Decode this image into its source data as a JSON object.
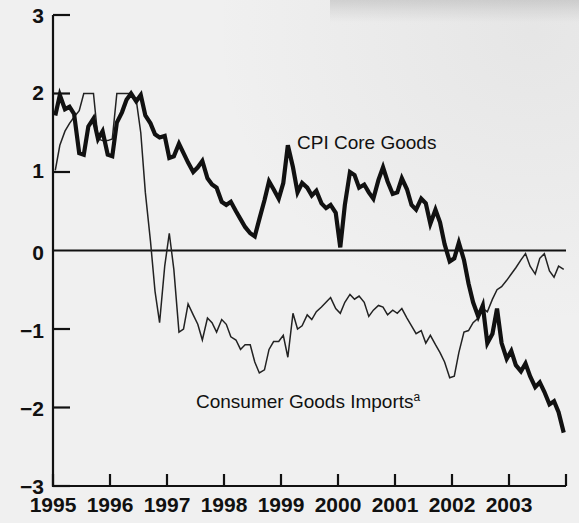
{
  "chart_data": {
    "type": "line",
    "title": "",
    "subtitle": "",
    "xlabel": "",
    "ylabel": "",
    "xlim": [
      1995.0,
      2004.0
    ],
    "ylim": [
      -3,
      3
    ],
    "grid": false,
    "legend_position": "inline-annotation",
    "y_ticks": [
      "3",
      "2",
      "1",
      "0",
      "−1",
      "−2",
      "−3"
    ],
    "y_tick_values": [
      3,
      2,
      1,
      0,
      -1,
      -2,
      -3
    ],
    "x_ticks": [
      "1995",
      "1996",
      "1997",
      "1998",
      "1999",
      "2000",
      "2001",
      "2002",
      "2003"
    ],
    "x_tick_values": [
      1995,
      1996,
      1997,
      1998,
      1999,
      2000,
      2001,
      2002,
      2003
    ],
    "zero_line": 0,
    "units": "percent change from year earlier",
    "series": [
      {
        "name": "CPI Core Goods",
        "label": "CPI Core Goods",
        "style": "thick",
        "color": "#111111",
        "line_width": 4.2,
        "label_x": 297,
        "label_y": 133,
        "x": [
          1995.04,
          1995.12,
          1995.21,
          1995.29,
          1995.37,
          1995.46,
          1995.54,
          1995.62,
          1995.71,
          1995.79,
          1995.87,
          1995.96,
          1996.04,
          1996.12,
          1996.21,
          1996.29,
          1996.37,
          1996.46,
          1996.54,
          1996.62,
          1996.71,
          1996.79,
          1996.87,
          1996.96,
          1997.04,
          1997.12,
          1997.21,
          1997.29,
          1997.37,
          1997.46,
          1997.54,
          1997.62,
          1997.71,
          1997.79,
          1997.87,
          1997.96,
          1998.04,
          1998.12,
          1998.21,
          1998.29,
          1998.37,
          1998.46,
          1998.54,
          1998.62,
          1998.71,
          1998.79,
          1998.87,
          1998.96,
          1999.04,
          1999.12,
          1999.21,
          1999.29,
          1999.37,
          1999.46,
          1999.54,
          1999.62,
          1999.71,
          1999.79,
          1999.87,
          1999.96,
          2000.04,
          2000.12,
          2000.21,
          2000.29,
          2000.37,
          2000.46,
          2000.54,
          2000.62,
          2000.71,
          2000.79,
          2000.87,
          2000.96,
          2001.04,
          2001.12,
          2001.21,
          2001.29,
          2001.37,
          2001.46,
          2001.54,
          2001.62,
          2001.71,
          2001.79,
          2001.87,
          2001.96,
          2002.04,
          2002.12,
          2002.21,
          2002.29,
          2002.37,
          2002.46,
          2002.54,
          2002.62,
          2002.71,
          2002.79,
          2002.87,
          2002.96,
          2003.04,
          2003.12,
          2003.21,
          2003.29,
          2003.37,
          2003.46,
          2003.54,
          2003.62,
          2003.71,
          2003.79,
          2003.87,
          2003.96
        ],
        "y": [
          1.72,
          1.98,
          1.8,
          1.83,
          1.74,
          1.24,
          1.22,
          1.58,
          1.68,
          1.42,
          1.52,
          1.22,
          1.2,
          1.63,
          1.76,
          1.92,
          2.0,
          1.9,
          1.98,
          1.72,
          1.62,
          1.48,
          1.44,
          1.46,
          1.18,
          1.2,
          1.36,
          1.24,
          1.12,
          1.0,
          1.06,
          1.14,
          0.92,
          0.84,
          0.8,
          0.62,
          0.58,
          0.62,
          0.5,
          0.4,
          0.3,
          0.22,
          0.18,
          0.4,
          0.64,
          0.88,
          0.78,
          0.66,
          0.86,
          1.34,
          1.06,
          0.74,
          0.86,
          0.8,
          0.7,
          0.76,
          0.6,
          0.54,
          0.58,
          0.48,
          0.04,
          0.58,
          1.0,
          0.96,
          0.8,
          0.84,
          0.74,
          0.66,
          0.9,
          1.06,
          0.88,
          0.72,
          0.74,
          0.92,
          0.78,
          0.58,
          0.52,
          0.66,
          0.6,
          0.34,
          0.52,
          0.36,
          0.08,
          -0.14,
          -0.1,
          0.1,
          -0.12,
          -0.42,
          -0.66,
          -0.84,
          -0.7,
          -1.18,
          -1.06,
          -0.74,
          -1.18,
          -1.38,
          -1.28,
          -1.46,
          -1.54,
          -1.44,
          -1.6,
          -1.74,
          -1.68,
          -1.8,
          -1.96,
          -1.92,
          -2.06,
          -2.32
        ]
      },
      {
        "name": "Consumer Goods Imports",
        "label": "Consumer Goods Imports",
        "label_superscript": "a",
        "style": "thin",
        "color": "#222222",
        "line_width": 1.5,
        "label_x": 196,
        "label_y": 392,
        "x": [
          1995.04,
          1995.12,
          1995.21,
          1995.29,
          1995.37,
          1995.46,
          1995.54,
          1995.62,
          1995.71,
          1995.79,
          1995.87,
          1995.96,
          1996.04,
          1996.12,
          1996.21,
          1996.29,
          1996.37,
          1996.46,
          1996.54,
          1996.62,
          1996.71,
          1996.79,
          1996.87,
          1996.96,
          1997.04,
          1997.12,
          1997.21,
          1997.29,
          1997.37,
          1997.46,
          1997.54,
          1997.62,
          1997.71,
          1997.79,
          1997.87,
          1997.96,
          1998.04,
          1998.12,
          1998.21,
          1998.29,
          1998.37,
          1998.46,
          1998.54,
          1998.62,
          1998.71,
          1998.79,
          1998.87,
          1998.96,
          1999.04,
          1999.12,
          1999.21,
          1999.29,
          1999.37,
          1999.46,
          1999.54,
          1999.62,
          1999.71,
          1999.79,
          1999.87,
          1999.96,
          2000.04,
          2000.12,
          2000.21,
          2000.29,
          2000.37,
          2000.46,
          2000.54,
          2000.62,
          2000.71,
          2000.79,
          2000.87,
          2000.96,
          2001.04,
          2001.12,
          2001.21,
          2001.29,
          2001.37,
          2001.46,
          2001.54,
          2001.62,
          2001.71,
          2001.79,
          2001.87,
          2001.96,
          2002.04,
          2002.12,
          2002.21,
          2002.29,
          2002.37,
          2002.46,
          2002.54,
          2002.62,
          2002.71,
          2002.79,
          2002.87,
          2002.96,
          2003.04,
          2003.12,
          2003.21,
          2003.29,
          2003.37,
          2003.46,
          2003.54,
          2003.62,
          2003.71,
          2003.79,
          2003.87,
          2003.96
        ],
        "y": [
          1.02,
          1.34,
          1.52,
          1.62,
          1.7,
          1.78,
          2.0,
          2.0,
          2.0,
          1.42,
          1.4,
          1.4,
          1.42,
          2.0,
          2.0,
          2.0,
          2.0,
          1.92,
          1.5,
          0.74,
          0.12,
          -0.52,
          -0.92,
          -0.2,
          0.22,
          -0.24,
          -1.04,
          -1.0,
          -0.68,
          -0.82,
          -0.94,
          -1.14,
          -0.86,
          -0.92,
          -1.04,
          -0.88,
          -0.94,
          -1.1,
          -1.14,
          -1.26,
          -1.2,
          -1.2,
          -1.42,
          -1.56,
          -1.52,
          -1.26,
          -1.16,
          -1.16,
          -1.08,
          -1.36,
          -0.8,
          -1.0,
          -0.96,
          -0.82,
          -0.88,
          -0.78,
          -0.72,
          -0.66,
          -0.6,
          -0.74,
          -0.8,
          -0.66,
          -0.56,
          -0.62,
          -0.58,
          -0.66,
          -0.84,
          -0.76,
          -0.7,
          -0.72,
          -0.82,
          -0.76,
          -0.8,
          -0.74,
          -0.86,
          -0.96,
          -1.06,
          -1.02,
          -1.18,
          -1.08,
          -1.2,
          -1.3,
          -1.42,
          -1.62,
          -1.6,
          -1.3,
          -1.04,
          -1.02,
          -0.92,
          -0.86,
          -0.74,
          -0.78,
          -0.62,
          -0.5,
          -0.46,
          -0.38,
          -0.3,
          -0.22,
          -0.12,
          -0.04,
          -0.2,
          -0.3,
          -0.1,
          -0.04,
          -0.26,
          -0.34,
          -0.2,
          -0.24
        ]
      }
    ]
  },
  "axes": {
    "left_px": 53,
    "right_px": 566,
    "top_px": 15,
    "bottom_px": 486,
    "zero_px": 252
  },
  "colors": {
    "background": "#f0f0f0",
    "axis": "#111111",
    "thick_series": "#111111",
    "thin_series": "#222222"
  }
}
